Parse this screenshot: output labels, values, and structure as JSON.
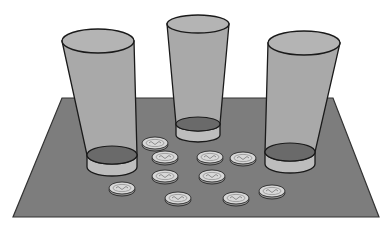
{
  "scene": {
    "description": "Three drinking glasses standing on a dark gray mat with ten coins scattered between them",
    "colors": {
      "background": "#ffffff",
      "mat": "#7d7d7d",
      "mat_edge": "#333333",
      "glass_body": "#a9a9a9",
      "glass_top": "#b4b4b4",
      "glass_bottom_inner": "#6a6a6a",
      "glass_base": "#bdbdbd",
      "outline": "#1a1a1a",
      "coin_face": "#d8d8d8",
      "coin_edge": "#9a9a9a"
    },
    "mat": {
      "points": "62,98 333,98 379,217 13,217"
    },
    "glasses": [
      {
        "name": "left-glass",
        "top": {
          "cx": 98,
          "cy": 41,
          "rx": 36,
          "ry": 12
        },
        "bottom": {
          "cx": 112,
          "cy": 155,
          "rx": 25,
          "ry": 9
        },
        "base_depth": 12
      },
      {
        "name": "middle-glass",
        "top": {
          "cx": 198,
          "cy": 24,
          "rx": 31,
          "ry": 9
        },
        "bottom": {
          "cx": 198,
          "cy": 124,
          "rx": 22,
          "ry": 7
        },
        "base_depth": 11
      },
      {
        "name": "right-glass",
        "top": {
          "cx": 304,
          "cy": 43,
          "rx": 36,
          "ry": 12
        },
        "bottom": {
          "cx": 290,
          "cy": 152,
          "rx": 25,
          "ry": 9
        },
        "base_depth": 12
      }
    ],
    "coins": [
      {
        "cx": 155,
        "cy": 143
      },
      {
        "cx": 165,
        "cy": 157
      },
      {
        "cx": 210,
        "cy": 157
      },
      {
        "cx": 243,
        "cy": 158
      },
      {
        "cx": 165,
        "cy": 176
      },
      {
        "cx": 212,
        "cy": 176
      },
      {
        "cx": 122,
        "cy": 188
      },
      {
        "cx": 178,
        "cy": 198
      },
      {
        "cx": 236,
        "cy": 198
      },
      {
        "cx": 272,
        "cy": 191
      }
    ],
    "coin_count": 10,
    "glass_count": 3
  }
}
